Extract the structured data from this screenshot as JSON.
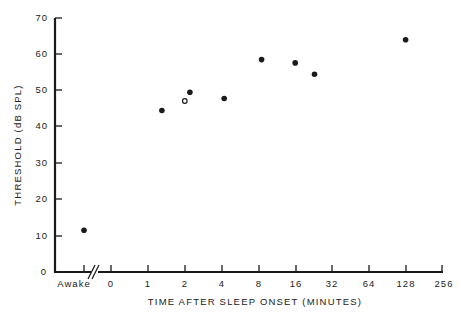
{
  "chart_data": {
    "type": "scatter",
    "title": "",
    "xlabel": "TIME AFTER SLEEP ONSET (MINUTES)",
    "ylabel": "THRESHOLD (dB SPL)",
    "ylim": [
      0,
      70
    ],
    "yticks": [
      0,
      10,
      20,
      30,
      40,
      50,
      60,
      70
    ],
    "x_scale": "log2 (with separate 'Awake' category and axis break)",
    "xticks": [
      "Awake",
      "0",
      "1",
      "2",
      "4",
      "8",
      "16",
      "32",
      "64",
      "128",
      "256"
    ],
    "grid": false,
    "legend": null,
    "series": [
      {
        "name": "filled",
        "marker": "filled-circle",
        "points": [
          {
            "x": "Awake",
            "y": 11.5
          },
          {
            "x": 1.3,
            "y": 44.5
          },
          {
            "x": 2.2,
            "y": 49.5
          },
          {
            "x": 4.2,
            "y": 47.8
          },
          {
            "x": 8.5,
            "y": 58.5
          },
          {
            "x": 16,
            "y": 57.6
          },
          {
            "x": 23,
            "y": 54.5
          },
          {
            "x": 128,
            "y": 64
          }
        ]
      },
      {
        "name": "open",
        "marker": "open-circle",
        "points": [
          {
            "x": 2.0,
            "y": 47.1
          }
        ]
      }
    ]
  },
  "labels": {
    "xlabel": "TIME AFTER SLEEP ONSET (MINUTES)",
    "ylabel": "THRESHOLD (dB SPL)",
    "y_ticks": [
      "0",
      "10",
      "20",
      "30",
      "40",
      "50",
      "60",
      "70"
    ],
    "x_ticks": [
      "Awake",
      "0",
      "1",
      "2",
      "4",
      "8",
      "16",
      "32",
      "64",
      "128",
      "256"
    ]
  }
}
